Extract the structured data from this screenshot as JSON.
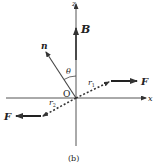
{
  "figure": {
    "caption": "(b)",
    "axes": {
      "z_label": "z",
      "x_label": "x",
      "origin_label": "O"
    },
    "vectors": {
      "B_label": "B",
      "n_label": "n",
      "angle_label": "θ",
      "r1_label": "r",
      "r1_sub": "1",
      "r2_label": "r",
      "r2_sub": "2",
      "F1_label": "F",
      "F2_label": "F"
    },
    "colors": {
      "ink": "#333333",
      "axis": "#555555"
    }
  }
}
